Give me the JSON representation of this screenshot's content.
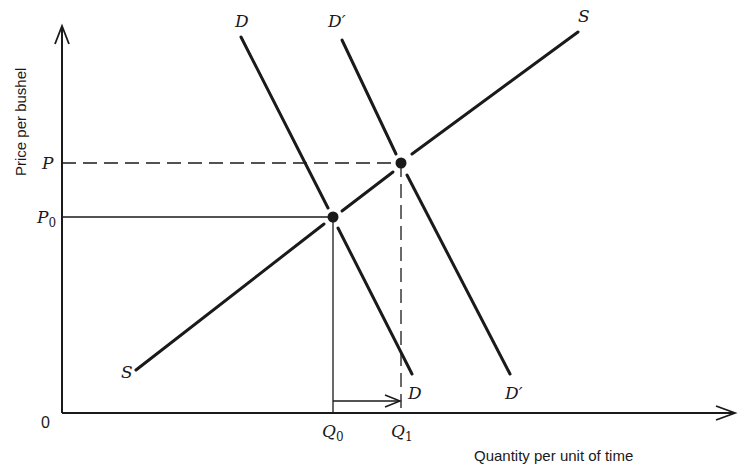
{
  "diagram": {
    "title": "",
    "axes": {
      "y_label": "Price per bushel",
      "x_label": "Quantity per unit of time",
      "origin_label": "0"
    },
    "price_levels": [
      {
        "name": "P",
        "base": "P",
        "sub": "",
        "style": "dashed"
      },
      {
        "name": "P0",
        "base": "P",
        "sub": "0",
        "style": "solid"
      }
    ],
    "quantity_levels": [
      {
        "name": "Q0",
        "base": "Q",
        "sub": "0",
        "style": "solid"
      },
      {
        "name": "Q1",
        "base": "Q",
        "sub": "1",
        "style": "dashed"
      }
    ],
    "curves": {
      "demand_original": {
        "top_label": "D",
        "bottom_label": "D"
      },
      "demand_shifted": {
        "top_label": "D′",
        "bottom_label": "D′"
      },
      "supply": {
        "top_label": "S",
        "bottom_label": "S"
      }
    },
    "equilibria": [
      {
        "name": "initial",
        "price": "P0",
        "quantity": "Q0"
      },
      {
        "name": "new",
        "price": "P",
        "quantity": "Q1"
      }
    ],
    "shift_arrow": {
      "from": "Q0",
      "to": "Q1",
      "direction": "right"
    },
    "colors": {
      "ink": "#1a1a1a",
      "background": "#ffffff"
    }
  }
}
